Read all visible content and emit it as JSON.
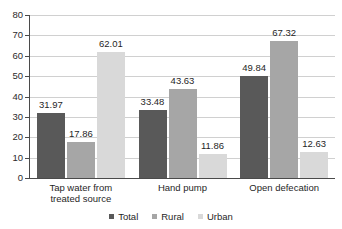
{
  "chart_data": {
    "type": "bar",
    "title": "",
    "subtitle": "",
    "xlabel": "",
    "ylabel": "",
    "ylim": [
      0,
      80
    ],
    "yticks": [
      0,
      10,
      20,
      30,
      40,
      50,
      60,
      70,
      80
    ],
    "grid": true,
    "legend_position": "bottom",
    "categories": [
      "Tap water from treated source",
      "Hand pump",
      "Open defecation"
    ],
    "category_lines": [
      [
        "Tap water from",
        "treated source"
      ],
      [
        "Hand pump",
        ""
      ],
      [
        "Open defecation",
        ""
      ]
    ],
    "series": [
      {
        "name": "Total",
        "color": "#595959",
        "values": [
          31.97,
          33.48,
          49.84
        ]
      },
      {
        "name": "Rural",
        "color": "#a6a6a6",
        "values": [
          17.86,
          43.63,
          67.32
        ]
      },
      {
        "name": "Urban",
        "color": "#d9d9d9",
        "values": [
          62.01,
          11.86,
          12.63
        ]
      }
    ],
    "data_labels": [
      [
        "31.97",
        "17.86",
        "62.01"
      ],
      [
        "33.48",
        "43.63",
        "11.86"
      ],
      [
        "49.84",
        "67.32",
        "12.63"
      ]
    ],
    "ytick_labels": [
      "80",
      "70",
      "60",
      "50",
      "40",
      "30",
      "20",
      "10",
      "0"
    ],
    "legend": [
      {
        "label": "Total",
        "color": "#595959"
      },
      {
        "label": "Rural",
        "color": "#a6a6a6"
      },
      {
        "label": "Urban",
        "color": "#d9d9d9"
      }
    ],
    "colors": {
      "total": "#595959",
      "rural": "#a6a6a6",
      "urban": "#d9d9d9",
      "gridline": "#d0d0d0",
      "axis": "#4a4a4a",
      "text": "#1f1f1f",
      "background": "#ffffff"
    }
  }
}
